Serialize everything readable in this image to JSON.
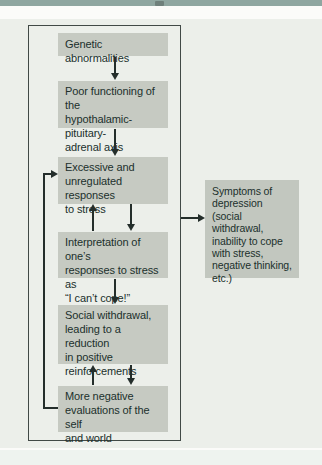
{
  "colors": {
    "top_bar": "#8FA6A0",
    "panel_background": "#ECEFEA",
    "node_fill": "#C6CAC2",
    "outcome_fill": "#C2C7BF",
    "text": "#20302C",
    "line": "#242E2B",
    "system_border": "#414946"
  },
  "figure": {
    "type": "flowchart",
    "boxes": [
      {
        "id": "genetic",
        "label": "Genetic abnormalities"
      },
      {
        "id": "hpa-axis",
        "label": "Poor functioning of the\nhypothalamic-pituitary-\nadrenal axis"
      },
      {
        "id": "stress-responses",
        "label": "Excessive and\nunregulated responses\nto stress"
      },
      {
        "id": "interpretation",
        "label": "Interpretation of one’s\nresponses to stress as\n“I can’t cope!”"
      },
      {
        "id": "social-withdrawal",
        "label": "Social withdrawal,\nleading to a reduction\nin positive\nreinforcements"
      },
      {
        "id": "negative-evaluations",
        "label": "More negative\nevaluations of the self\nand world"
      }
    ],
    "outcome": {
      "id": "symptoms",
      "label": "Symptoms of\ndepression (social\nwithdrawal,\ninability to cope\nwith stress,\nnegative thinking,\netc.)"
    },
    "edges": [
      {
        "from": "genetic",
        "to": "hpa-axis",
        "style": "arrow-down"
      },
      {
        "from": "hpa-axis",
        "to": "stress-responses",
        "style": "arrow-down"
      },
      {
        "from": "stress-responses",
        "to": "interpretation",
        "style": "bidirectional"
      },
      {
        "from": "interpretation",
        "to": "social-withdrawal",
        "style": "arrow-down"
      },
      {
        "from": "social-withdrawal",
        "to": "negative-evaluations",
        "style": "bidirectional"
      },
      {
        "from": "negative-evaluations",
        "to": "stress-responses",
        "style": "feedback-loop-left"
      },
      {
        "from": "system-boundary",
        "to": "symptoms",
        "style": "arrow-right"
      }
    ]
  }
}
